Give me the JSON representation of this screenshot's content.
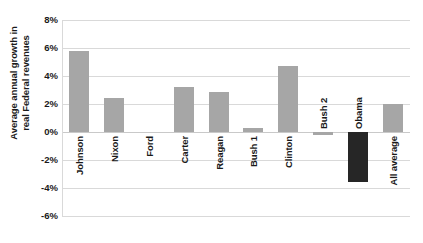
{
  "chart_data": {
    "type": "bar",
    "title": "",
    "xlabel": "",
    "ylabel": "Average annual growth in real Federal revenues",
    "ylabel_lines": [
      "Average annual growth in",
      "real Federal revenues"
    ],
    "categories": [
      "Johnson",
      "Nixon",
      "Ford",
      "Carter",
      "Reagan",
      "Bush 1",
      "Clinton",
      "Bush 2",
      "Obama",
      "All average"
    ],
    "values": [
      5.8,
      2.4,
      0.0,
      3.25,
      2.85,
      0.3,
      4.7,
      -0.2,
      -3.6,
      2.0
    ],
    "ylim": [
      -6,
      8
    ],
    "ytick_values": [
      8,
      6,
      4,
      2,
      0,
      -2,
      -4,
      -6
    ],
    "ytick_labels": [
      "8%",
      "6%",
      "4%",
      "2%",
      "0%",
      "-2%",
      "-4%",
      "-6%"
    ],
    "grid": true,
    "legend": "none",
    "bar_colors": [
      "#a6a6a6",
      "#a6a6a6",
      "#a6a6a6",
      "#a6a6a6",
      "#a6a6a6",
      "#a6a6a6",
      "#a6a6a6",
      "#a6a6a6",
      "#262626",
      "#a6a6a6"
    ],
    "highlight_category": "Obama",
    "highlight_color": "#262626",
    "default_bar_color": "#a6a6a6",
    "gridline_color": "#d9d9d9",
    "text_color": "#1a1a1a",
    "background_color": "#ffffff"
  }
}
